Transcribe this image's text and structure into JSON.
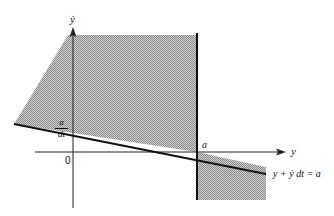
{
  "diagram": {
    "labels": {
      "y_axis": "ẏ",
      "x_axis": "y",
      "origin": "0",
      "a_point": "a",
      "intercept_num": "a",
      "intercept_den": "dt",
      "line_equation": "y + ẏ dt = a"
    },
    "colors": {
      "shade": "#b5b5b5",
      "line": "#111111"
    }
  }
}
